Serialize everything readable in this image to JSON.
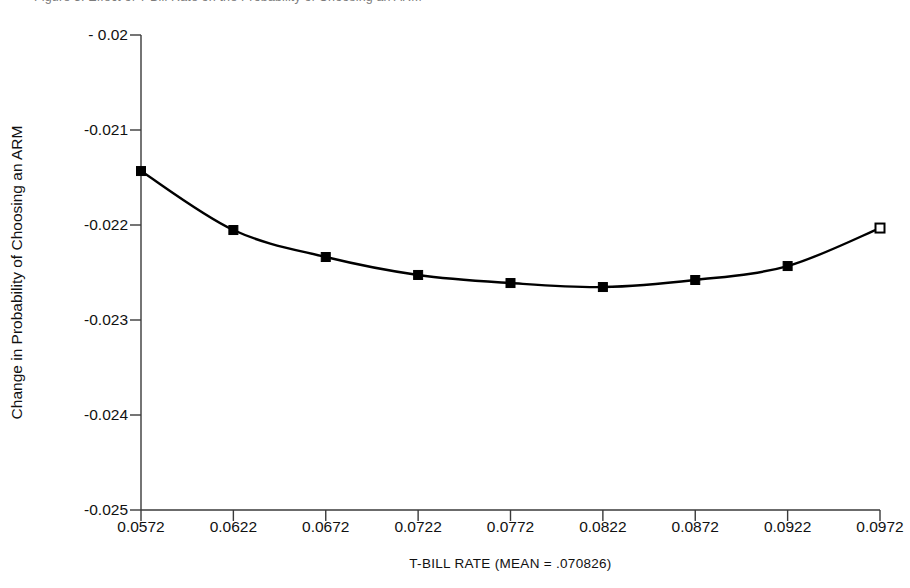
{
  "figure": {
    "top_caption_clipped": "Figure 3. Effect of T-Bill Rate on the Probability of Choosing an ARM"
  },
  "chart_data": {
    "type": "line",
    "title": "",
    "subtitle": "",
    "xlabel": "T-BILL RATE (MEAN = .070826)",
    "ylabel": "Change in Probability of Choosing an ARM",
    "xlim": [
      0.0572,
      0.0972
    ],
    "ylim": [
      -0.025,
      -0.02
    ],
    "grid": false,
    "legend": "none",
    "xticks": [
      "0.0572",
      "0.0622",
      "0.0672",
      "0.0722",
      "0.0772",
      "0.0822",
      "0.0872",
      "0.0922",
      "0.0972"
    ],
    "xtick_values": [
      0.0572,
      0.0622,
      0.0672,
      0.0722,
      0.0772,
      0.0822,
      0.0872,
      0.0922,
      0.0972
    ],
    "yticks": [
      "- 0.02",
      "-0.021",
      "-0.022",
      "-0.023",
      "-0.024",
      "-0.025"
    ],
    "ytick_values": [
      -0.02,
      -0.021,
      -0.022,
      -0.023,
      -0.024,
      -0.025
    ],
    "series": [
      {
        "name": "Change in Probability of Choosing an ARM",
        "x": [
          0.0572,
          0.0622,
          0.0672,
          0.0722,
          0.0772,
          0.0822,
          0.0872,
          0.0922,
          0.0972
        ],
        "values": [
          -0.021432,
          -0.022053,
          -0.022337,
          -0.022526,
          -0.022611,
          -0.022653,
          -0.022579,
          -0.022432,
          -0.022032
        ],
        "marker": "square",
        "marker_fill": "filled",
        "last_marker_fill": "open",
        "line_color": "#000000"
      }
    ]
  }
}
